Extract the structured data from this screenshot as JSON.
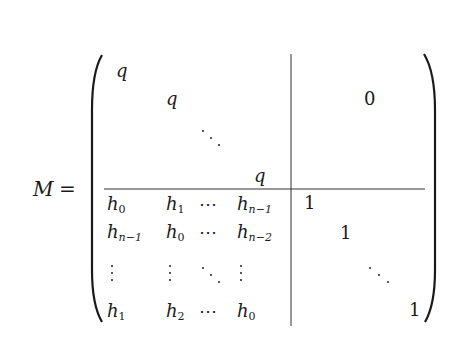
{
  "equation": {
    "lhs": "M",
    "equals": "=",
    "top_left_block": {
      "diagonal_entries": [
        "q",
        "q",
        "q"
      ],
      "ellipsis": "⋱"
    },
    "top_right_block": {
      "entry": "0"
    },
    "bottom_left_block": {
      "rows": [
        [
          {
            "base": "h",
            "sub": "0"
          },
          {
            "base": "h",
            "sub": "1"
          },
          "⋯",
          {
            "base": "h",
            "sub": "n−1"
          }
        ],
        [
          {
            "base": "h",
            "sub": "n−1"
          },
          {
            "base": "h",
            "sub": "0"
          },
          "⋯",
          {
            "base": "h",
            "sub": "n−2"
          }
        ],
        [
          "⋮",
          "⋮",
          "⋱",
          "⋮"
        ],
        [
          {
            "base": "h",
            "sub": "1"
          },
          {
            "base": "h",
            "sub": "2"
          },
          "⋯",
          {
            "base": "h",
            "sub": "0"
          }
        ]
      ]
    },
    "bottom_right_block": {
      "diagonal_entries": [
        "1",
        "1",
        "1"
      ],
      "ellipsis": "⋱"
    }
  },
  "glyphs": {
    "h": "h",
    "q": "q",
    "one": "1",
    "zero": "0",
    "cdots": "⋯",
    "s0": "0",
    "s1": "1",
    "s2": "2",
    "sn1": "n−1",
    "sn2": "n−2"
  }
}
